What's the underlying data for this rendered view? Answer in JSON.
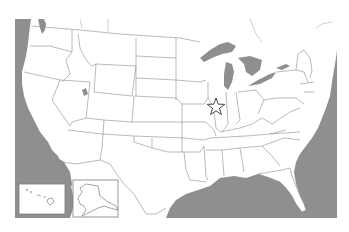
{
  "map": {
    "title": "United States map",
    "type": "outline map of the United States with state borders",
    "colors": {
      "land": "#ffffff",
      "water": "#8f8f8f",
      "borders": "#8c8c8c",
      "marker_stroke": "#333333"
    },
    "marker": {
      "shape": "star",
      "style": "outlined",
      "location_description": "Southern Illinois / Missouri border region near St. Louis"
    },
    "insets": [
      {
        "name": "Hawaii",
        "position": "bottom-left"
      },
      {
        "name": "Alaska",
        "position": "bottom-left, right of Hawaii"
      }
    ]
  }
}
